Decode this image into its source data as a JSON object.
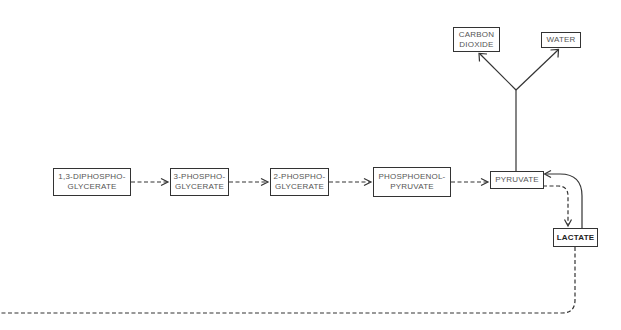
{
  "diagram": {
    "type": "metabolic-pathway",
    "colors": {
      "line": "#333333",
      "text": "#555555",
      "background": "#ffffff"
    },
    "nodes": {
      "diphosphoglycerate": {
        "line1": "1,3-DIPHOSPHO-",
        "line2": "GLYCERATE"
      },
      "phosphoglycerate3": {
        "line1": "3-PHOSPHO-",
        "line2": "GLYCERATE"
      },
      "phosphoglycerate2": {
        "line1": "2-PHOSPHO-",
        "line2": "GLYCERATE"
      },
      "phosphoenolpyruvate": {
        "line1": "PHOSPHOENOL-",
        "line2": "PYRUVATE"
      },
      "pyruvate": {
        "label": "PYRUVATE"
      },
      "carbon_dioxide": {
        "line1": "CARBON",
        "line2": "DIOXIDE"
      },
      "water": {
        "label": "WATER"
      },
      "lactate": {
        "label": "LACTATE"
      }
    },
    "edges": [
      {
        "from": "1,3-DIPHOSPHOGLYCERATE",
        "to": "3-PHOSPHOGLYCERATE",
        "style": "dashed"
      },
      {
        "from": "3-PHOSPHOGLYCERATE",
        "to": "2-PHOSPHOGLYCERATE",
        "style": "dashed"
      },
      {
        "from": "2-PHOSPHOGLYCERATE",
        "to": "PHOSPHOENOLPYRUVATE",
        "style": "dashed"
      },
      {
        "from": "PHOSPHOENOLPYRUVATE",
        "to": "PYRUVATE",
        "style": "dashed"
      },
      {
        "from": "PYRUVATE",
        "to": "CARBON DIOXIDE",
        "style": "solid"
      },
      {
        "from": "PYRUVATE",
        "to": "WATER",
        "style": "solid"
      },
      {
        "from": "PYRUVATE",
        "to": "LACTATE",
        "style": "dashed"
      },
      {
        "from": "LACTATE",
        "to": "PYRUVATE",
        "style": "solid"
      },
      {
        "from": "LACTATE",
        "to": "off-page (left)",
        "style": "dashed"
      }
    ]
  }
}
